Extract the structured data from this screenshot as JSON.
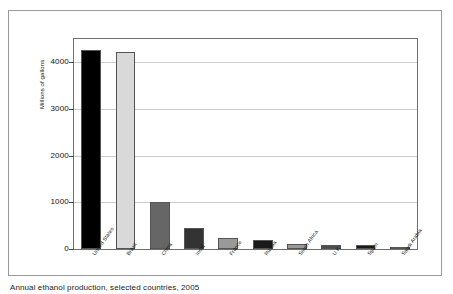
{
  "figure": {
    "caption": "Annual ethanol production, selected countries, 2005"
  },
  "chart_data": {
    "type": "bar",
    "title": "",
    "subtitle": "",
    "xlabel": "",
    "ylabel": "Millions of gallons",
    "categories": [
      "United States",
      "Brazil",
      "China",
      "India",
      "France",
      "Russia",
      "South Africa",
      "U.K.",
      "Spain",
      "Saudi Arabia"
    ],
    "values": [
      4264,
      4227,
      1017,
      449,
      240,
      198,
      103,
      92,
      93,
      32
    ],
    "bar_colors": [
      "#000000",
      "#d9d9d9",
      "#666666",
      "#333333",
      "#999999",
      "#1a1a1a",
      "#999999",
      "#4d4d4d",
      "#1a1a1a",
      "#b3b3b3"
    ],
    "ylim": [
      0,
      4500
    ],
    "yticks": [
      0,
      1000,
      2000,
      3000,
      4000
    ],
    "ytick_labels": [
      "0",
      "1000",
      "2000",
      "3000",
      "4000"
    ],
    "grid": true,
    "grid_axis": "y",
    "legend": false,
    "legend_position": "none"
  }
}
